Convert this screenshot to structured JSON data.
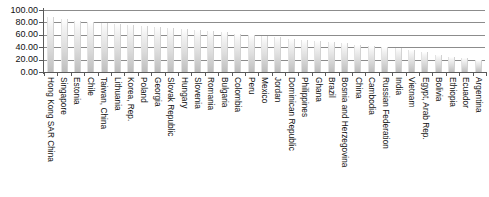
{
  "chart_data": {
    "type": "bar",
    "title": "",
    "subtitle": "",
    "xlabel": "",
    "ylabel": "",
    "ylim": [
      0,
      100
    ],
    "yticks": [
      "0.00",
      "20.00",
      "40.00",
      "60.00",
      "80.00",
      "100.00"
    ],
    "ytick_values": [
      0,
      20,
      40,
      60,
      80,
      100
    ],
    "grid": "horizontal",
    "legend": "none",
    "legend_position": "none",
    "bar_fill": "#dcdcdc",
    "axis_color": "#5a5a5a",
    "grid_color": "#8c8c8c",
    "categories": [
      "Hong Kong SAR China",
      "Singapore",
      "Estonia",
      "Chile",
      "Taiwan, China",
      "Lithuania",
      "Korea, Rep.",
      "Poland",
      "Georgia",
      "Slovak Republic",
      "Hungary",
      "Slovenia",
      "Romania",
      "Bulgaria",
      "Colombia",
      "Peru",
      "Mexico",
      "Jordan",
      "Dominican Republic",
      "Philippines",
      "Ghana",
      "Brazil",
      "Bosnia and Herzegovina",
      "China",
      "Cambodia",
      "Russian Federation",
      "India",
      "Vietnam",
      "Egypt, Arab Rep.",
      "Bolivia",
      "Ethiopia",
      "Ecuador",
      "Argentina"
    ],
    "values": [
      88,
      85,
      83,
      81,
      79,
      78,
      76,
      75,
      73,
      71,
      70,
      68,
      66,
      64,
      62,
      60,
      58,
      56,
      54,
      52,
      50,
      48,
      46,
      44,
      42,
      40,
      38,
      35,
      32,
      28,
      25,
      22,
      20
    ]
  }
}
